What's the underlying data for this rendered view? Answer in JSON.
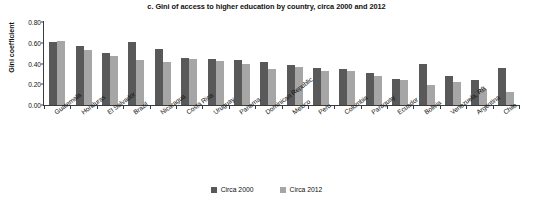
{
  "chart_data": {
    "type": "bar",
    "title": "c. Gini of access to higher education by country, circa 2000 and 2012",
    "xlabel": "",
    "ylabel": "Gini coefficient",
    "ylim": [
      0.0,
      0.8
    ],
    "yticks": [
      "0.00",
      "0.20",
      "0.40",
      "0.60",
      "0.80"
    ],
    "ytick_values": [
      0.0,
      0.2,
      0.4,
      0.6,
      0.8
    ],
    "grid": false,
    "legend_position": "bottom",
    "categories": [
      "Guatemala",
      "Honduras",
      "El Salvador",
      "Brazil",
      "Nicaragua",
      "Costa Rica",
      "Uruguay",
      "Panama",
      "Dominican Republic",
      "Mexico",
      "Peru",
      "Colombia",
      "Paraguay",
      "Ecuador",
      "Bolivia",
      "Venezuela, RB",
      "Argentina",
      "Chile"
    ],
    "series": [
      {
        "name": "Circa 2000",
        "color": "#595959",
        "values": [
          0.61,
          0.57,
          0.5,
          0.61,
          0.54,
          0.45,
          0.44,
          0.43,
          0.41,
          0.39,
          0.36,
          0.35,
          0.31,
          0.25,
          0.4,
          0.28,
          0.24,
          0.36
        ]
      },
      {
        "name": "Circa 2012",
        "color": "#a6a6a6",
        "values": [
          0.62,
          0.53,
          0.47,
          0.43,
          0.41,
          0.44,
          0.42,
          0.4,
          0.35,
          0.37,
          0.33,
          0.33,
          0.28,
          0.24,
          0.19,
          0.22,
          0.15,
          0.13
        ]
      }
    ]
  }
}
